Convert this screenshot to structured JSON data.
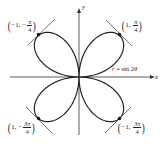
{
  "diagram": {
    "title": "",
    "curve": {
      "equation": "r = sin 2θ",
      "equation_parts": {
        "r": "r",
        "eq": " = sin 2",
        "theta": "θ"
      },
      "type": "four-leaf rose",
      "stroke_color": "#222222"
    },
    "axes": {
      "x_label": "x",
      "y_label": "y",
      "color": "#333333"
    },
    "points": [
      {
        "id": "top-left",
        "r": "−1",
        "theta_num": "π",
        "theta_sign": "−",
        "theta_den": "4"
      },
      {
        "id": "top-right",
        "r": "1",
        "theta_num": "π",
        "theta_sign": "",
        "theta_den": "4"
      },
      {
        "id": "bottom-left",
        "r": "1",
        "theta_num": "3π",
        "theta_sign": "−",
        "theta_den": "4"
      },
      {
        "id": "bottom-right",
        "r": "−1",
        "theta_num": "3π",
        "theta_sign": "",
        "theta_den": "4"
      }
    ],
    "tangent_lines": "Tangent lines drawn at each of the four marked points"
  }
}
